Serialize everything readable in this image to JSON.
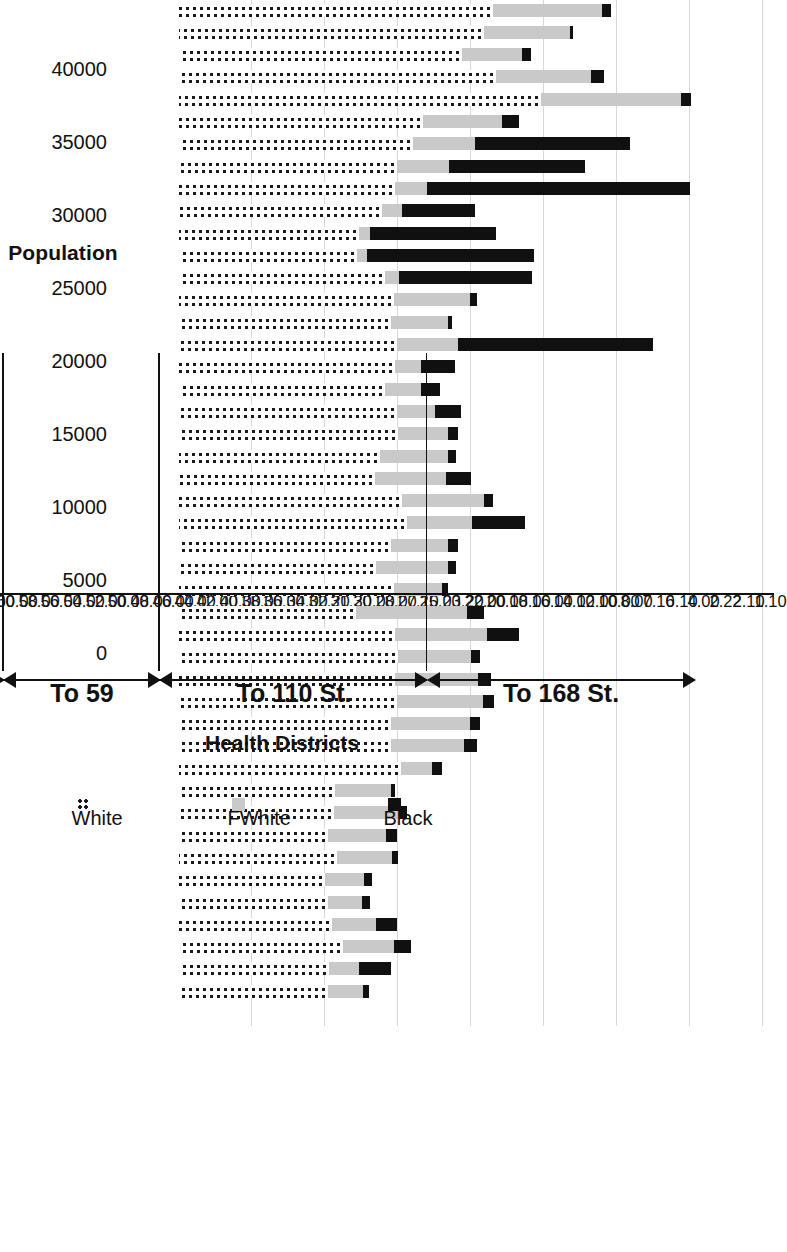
{
  "chart_data": {
    "type": "bar",
    "subtype": "stacked-horizontal",
    "title": "",
    "xlabel": "Health Districts",
    "ylabel": "Population",
    "ylim": [
      0,
      40000
    ],
    "ytick_labels": [
      "40000",
      "35000",
      "30000",
      "25000",
      "20000",
      "15000",
      "10000",
      "5000",
      "0"
    ],
    "ytick_values": [
      40000,
      35000,
      30000,
      25000,
      20000,
      15000,
      10000,
      5000,
      0
    ],
    "grid": true,
    "legend_position": "bottom-right",
    "legend": [
      {
        "name": "White",
        "style": "dotted"
      },
      {
        "name": "FWhite",
        "style": "light-gray"
      },
      {
        "name": "Black",
        "style": "solid-black"
      }
    ],
    "categories": [
      "1.10",
      "2.10",
      "2.22",
      "4.00",
      "6.10",
      "7.10",
      "8.00",
      "10.00",
      "12.00",
      "14.00",
      "16.00",
      "18.00",
      "20.00",
      "22.00",
      "23.20",
      "25.00",
      "27.10",
      "28.00",
      "30.00",
      "31.20",
      "32.20",
      "34.00",
      "36.00",
      "38.00",
      "40.00",
      "42.00",
      "44.00",
      "46.00",
      "48.00",
      "50.00",
      "52.00",
      "54.00",
      "56.00",
      "58.00",
      "60.00",
      "62.00",
      "64.00",
      "66.00",
      "68.00",
      "70.00",
      "72.00",
      "74.00",
      "76.00",
      "78.00",
      "80.00"
    ],
    "series": [
      {
        "name": "White",
        "values": [
          21500,
          20900,
          19400,
          21700,
          24800,
          16700,
          16000,
          14900,
          14800,
          13900,
          12300,
          12200,
          14100,
          14700,
          14500,
          14900,
          14800,
          14100,
          14900,
          15000,
          13800,
          13400,
          15300,
          15600,
          14500,
          13500,
          14700,
          12100,
          14800,
          15000,
          14800,
          14900,
          14500,
          14500,
          15200,
          10700,
          10600,
          10200,
          10800,
          10000,
          10200,
          10500,
          11200,
          10300,
          10200
        ]
      },
      {
        "name": "FWhite",
        "values": [
          7500,
          5900,
          4100,
          6500,
          9600,
          5400,
          4300,
          3600,
          2200,
          1400,
          800,
          700,
          1000,
          5200,
          3900,
          4200,
          1800,
          2500,
          2600,
          3400,
          4600,
          4900,
          5600,
          4500,
          3900,
          4900,
          3300,
          7600,
          6300,
          5000,
          5700,
          5900,
          5400,
          5000,
          2100,
          3800,
          4500,
          4000,
          3800,
          2700,
          2300,
          3000,
          3500,
          2000,
          2400
        ]
      },
      {
        "name": "Black",
        "values": [
          600,
          200,
          600,
          900,
          700,
          1200,
          10600,
          9300,
          18000,
          5000,
          8600,
          11400,
          9100,
          500,
          300,
          13400,
          2300,
          1300,
          1800,
          700,
          600,
          1700,
          600,
          3600,
          700,
          600,
          400,
          1200,
          2200,
          600,
          900,
          800,
          700,
          900,
          700,
          300,
          500,
          700,
          400,
          500,
          600,
          1400,
          1200,
          2200,
          400
        ]
      }
    ],
    "groups": [
      {
        "label": "To 168 St.",
        "from_index": 3,
        "to_index": 15
      },
      {
        "label": "To 110 St.",
        "from_index": 15,
        "to_index": 27
      },
      {
        "label": "To 59",
        "from_index": 27,
        "to_index": 34
      },
      {
        "label": "To 14",
        "from_index": 34,
        "to_index": 44
      }
    ]
  }
}
